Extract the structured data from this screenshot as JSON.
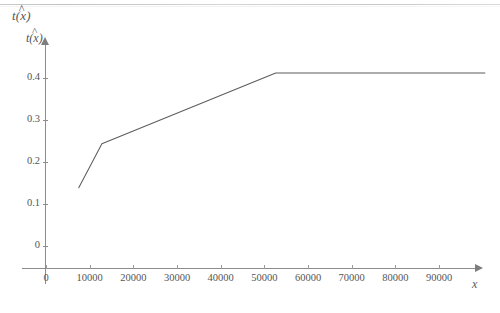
{
  "figure": {
    "outer_label": "t(x)",
    "outer_label_hat": "^",
    "y_axis_label": "t(x)",
    "y_axis_label_hat": "^",
    "x_axis_label": "x",
    "line_color": "#5d5d5d",
    "axis_color": "#8d8d8d",
    "background_color": "#ffffff"
  },
  "chart_data": {
    "type": "line",
    "title": "",
    "subtitle": "",
    "xlabel": "x",
    "ylabel": "t(x)",
    "grid": false,
    "legend": null,
    "xlim": [
      0,
      95000
    ],
    "ylim": [
      0,
      0.45
    ],
    "xticks": [
      0,
      10000,
      20000,
      30000,
      40000,
      50000,
      60000,
      70000,
      80000,
      90000
    ],
    "xticklabels": [
      "0",
      "10000",
      "20000",
      "30000",
      "40000",
      "50000",
      "60000",
      "70000",
      "80000",
      "90000"
    ],
    "yticks": [
      0,
      0.1,
      0.2,
      0.3,
      0.4
    ],
    "yticklabels": [
      "0",
      "0.1",
      "0.2",
      "0.3",
      "0.4"
    ],
    "series": [
      {
        "name": "t(x)",
        "x": [
          7500,
          12800,
          52600,
          100500
        ],
        "y": [
          0.138,
          0.243,
          0.412,
          0.412
        ]
      }
    ],
    "annotations": []
  }
}
